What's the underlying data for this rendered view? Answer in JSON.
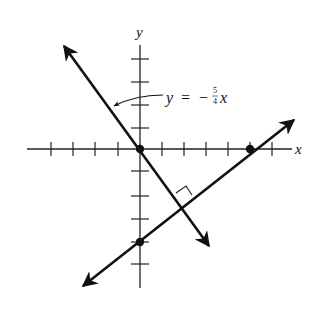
{
  "diagram": {
    "type": "coordinate-plane",
    "axes": {
      "x_label": "x",
      "y_label": "y",
      "tick_spacing_units": 1
    },
    "lines": [
      {
        "name": "given-line",
        "equation_label": {
          "lhs": "y",
          "eq": "=",
          "sign": "−",
          "num": "5",
          "den": "4",
          "var": "x"
        },
        "slope": "-5/4",
        "passes_through": [
          [
            0,
            0
          ]
        ]
      },
      {
        "name": "perpendicular-line",
        "slope": "4/5",
        "passes_through": [
          [
            0,
            -4
          ],
          [
            5,
            0
          ]
        ]
      }
    ],
    "points": [
      {
        "name": "origin",
        "coords": [
          0,
          0
        ]
      },
      {
        "name": "x-intercept",
        "coords": [
          5,
          0
        ]
      },
      {
        "name": "y-intercept",
        "coords": [
          0,
          -4
        ]
      }
    ],
    "annotations": [
      {
        "type": "right-angle-marker",
        "at": "intersection of the two lines"
      }
    ]
  }
}
